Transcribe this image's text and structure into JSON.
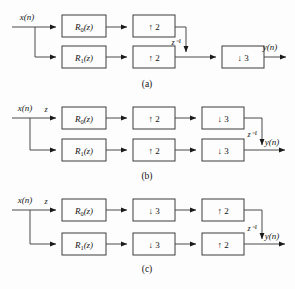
{
  "figure": {
    "input_label": "x(n)",
    "output_label": "y(n)",
    "delay_label": "z⁻¹",
    "advance_label": "z",
    "filter_top": "R₀(z)",
    "filter_bottom": "R₁(z)",
    "filter_top_base": "R",
    "filter_top_sub": "0",
    "filter_top_arg": "(z)",
    "filter_bottom_base": "R",
    "filter_bottom_sub": "1",
    "filter_bottom_arg": "(z)",
    "up2": "↑ 2",
    "up2_factor": "2",
    "down3": "↓ 3",
    "down3_factor": "3"
  },
  "diagrams": [
    {
      "id": "a",
      "caption": "(a)",
      "input_label": "x(n)",
      "output_label": "y(n)",
      "delay_label": "z⁻¹",
      "branch_label": "",
      "top_chain": [
        "R₀(z)",
        "↑ 2"
      ],
      "bottom_chain": [
        "R₁(z)",
        "↑ 2"
      ],
      "shared_output_block": "↓ 3",
      "delay_position": "top-branch-vertical"
    },
    {
      "id": "b",
      "caption": "(b)",
      "input_label": "x(n)",
      "output_label": "y(n)",
      "delay_label": "z⁻¹",
      "branch_label": "z",
      "top_chain": [
        "R₀(z)",
        "↑ 2",
        "↓ 3"
      ],
      "bottom_chain": [
        "R₁(z)",
        "↑ 2",
        "↓ 3"
      ],
      "shared_output_block": "",
      "delay_position": "right-vertical"
    },
    {
      "id": "c",
      "caption": "(c)",
      "input_label": "x(n)",
      "output_label": "y(n)",
      "delay_label": "z⁻¹",
      "branch_label": "z",
      "top_chain": [
        "R₀(z)",
        "↓ 3",
        "↑ 2"
      ],
      "bottom_chain": [
        "R₁(z)",
        "↓ 3",
        "↑ 2"
      ],
      "shared_output_block": "",
      "delay_position": "right-vertical"
    }
  ]
}
